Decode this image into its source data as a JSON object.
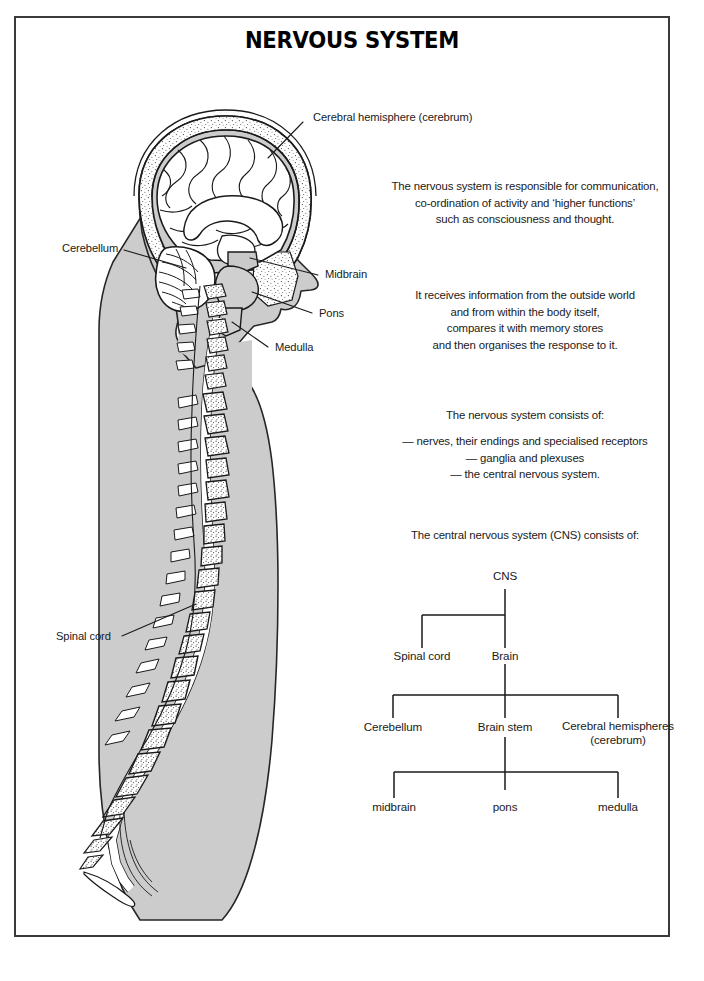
{
  "document": {
    "title": "NERVOUS SYSTEM",
    "background_color": "#ffffff",
    "border_color": "#3a3a3a",
    "body_silhouette_color": "#cccccc",
    "bone_color": "#ffffff",
    "ink_color": "#1a1a1a"
  },
  "illustration": {
    "caption_labels": [
      {
        "id": "cerebral-hemisphere",
        "text": "Cerebral hemisphere (cerebrum)"
      },
      {
        "id": "cerebellum",
        "text": "Cerebellum"
      },
      {
        "id": "midbrain",
        "text": "Midbrain"
      },
      {
        "id": "pons",
        "text": "Pons"
      },
      {
        "id": "medulla",
        "text": "Medulla"
      },
      {
        "id": "spinal-cord",
        "text": "Spinal cord"
      }
    ]
  },
  "text_blocks": {
    "paragraph1": {
      "lines": [
        "The nervous system is responsible for communication,",
        "co-ordination of activity and ‘higher functions’",
        "such as consciousness and thought."
      ]
    },
    "paragraph2": {
      "lines": [
        "It receives information from the outside world",
        "and from within the body itself,",
        "compares it with memory stores",
        "and then organises the response to it."
      ]
    },
    "paragraph3": {
      "heading": "The nervous system consists of:",
      "items": [
        "— nerves, their endings and specialised receptors",
        "— ganglia and plexuses",
        "— the central nervous system."
      ]
    },
    "paragraph4": {
      "heading": "The central nervous system (CNS) consists of:"
    }
  },
  "tree": {
    "root": "CNS",
    "level1": [
      "Spinal cord",
      "Brain"
    ],
    "level2": [
      "Cerebellum",
      "Brain stem"
    ],
    "level2_multiline": {
      "line1": "Cerebral hemispheres",
      "line2": "(cerebrum)"
    },
    "level3": [
      "midbrain",
      "pons",
      "medulla"
    ]
  }
}
